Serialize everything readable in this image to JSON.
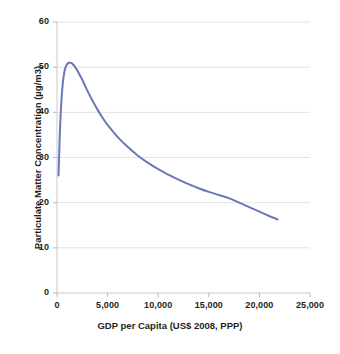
{
  "chart_data": {
    "type": "line",
    "title": "",
    "xlabel": "GDP per Capita (US$ 2008, PPP)",
    "ylabel": "Particulate Matter Concentration (µg/m3)",
    "xlim": [
      0,
      25000
    ],
    "ylim": [
      0,
      60
    ],
    "grid": true,
    "legend": "none",
    "x_ticks": [
      "0",
      "5,000",
      "10,000",
      "15,000",
      "20,000",
      "25,000"
    ],
    "x_tick_values": [
      0,
      5000,
      10000,
      15000,
      20000,
      25000
    ],
    "y_ticks": [
      "0",
      "10",
      "20",
      "30",
      "40",
      "50",
      "60"
    ],
    "y_tick_values": [
      0,
      10,
      20,
      30,
      40,
      50,
      60
    ],
    "line_color": "#6b78b8",
    "line_width": 2,
    "series": [
      {
        "name": "Particulate Matter Concentration",
        "x": [
          150,
          300,
          450,
          600,
          750,
          900,
          1100,
          1300,
          1500,
          1800,
          2100,
          2500,
          3000,
          3500,
          4000,
          4500,
          5000,
          6000,
          7000,
          8000,
          9000,
          10000,
          11000,
          12000,
          13000,
          14000,
          15000,
          16000,
          17000,
          18000,
          19000,
          20000,
          21000,
          21800
        ],
        "y": [
          26.0,
          36.5,
          43.0,
          47.0,
          49.2,
          50.3,
          50.9,
          51.0,
          50.8,
          50.0,
          48.9,
          47.2,
          44.8,
          42.6,
          40.6,
          38.8,
          37.2,
          34.5,
          32.3,
          30.4,
          28.8,
          27.4,
          26.2,
          25.1,
          24.1,
          23.2,
          22.4,
          21.7,
          21.0,
          20.0,
          19.0,
          18.0,
          17.0,
          16.3
        ]
      }
    ]
  },
  "axis": {
    "x_title": "GDP per Capita (US$ 2008, PPP)",
    "y_title": "Particulate Matter Concentration (µg/m3)"
  }
}
